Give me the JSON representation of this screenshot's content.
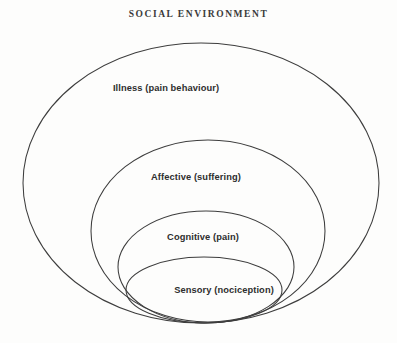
{
  "diagram": {
    "title": "SOCIAL ENVIRONMENT",
    "type": "nested-ellipse-venn",
    "background_color": "#fdfdfc",
    "stroke_color": "#3d3d3d",
    "text_color": "#2e2e2e",
    "rings": [
      {
        "label": "Illness (pain behaviour)",
        "level": 1,
        "cx": 201,
        "cy": 183,
        "rx": 178,
        "ry": 140,
        "label_x": 166,
        "label_y": 83
      },
      {
        "label": "Affective (suffering)",
        "level": 2,
        "cx": 208,
        "cy": 231,
        "rx": 117,
        "ry": 91,
        "label_x": 196,
        "label_y": 172
      },
      {
        "label": "Cognitive (pain)",
        "level": 3,
        "cx": 206,
        "cy": 267,
        "rx": 88,
        "ry": 56,
        "label_x": 203,
        "label_y": 232
      },
      {
        "label": "Sensory (nociception)",
        "level": 4,
        "cx": 204,
        "cy": 290,
        "rx": 78,
        "ry": 33,
        "label_x": 224,
        "label_y": 285
      }
    ]
  }
}
